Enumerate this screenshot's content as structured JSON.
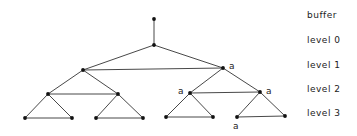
{
  "diagram": {
    "type": "tree",
    "colors": {
      "stroke": "#333333",
      "node": "#111111",
      "background": "#ffffff"
    },
    "level_labels": [
      {
        "text": "buffer",
        "y": 10
      },
      {
        "text": "level 0",
        "y": 35
      },
      {
        "text": "level 1",
        "y": 60
      },
      {
        "text": "level 2",
        "y": 84
      },
      {
        "text": "level 3",
        "y": 108
      }
    ],
    "nodes": [
      {
        "id": "buf",
        "x": 154,
        "y": 19
      },
      {
        "id": "r",
        "x": 154,
        "y": 45
      },
      {
        "id": "L",
        "x": 83,
        "y": 70
      },
      {
        "id": "R",
        "x": 223,
        "y": 68,
        "label": "a"
      },
      {
        "id": "LL",
        "x": 48,
        "y": 94
      },
      {
        "id": "LR",
        "x": 118,
        "y": 94
      },
      {
        "id": "RL",
        "x": 190,
        "y": 93,
        "label": "a"
      },
      {
        "id": "RR",
        "x": 260,
        "y": 92,
        "label": "a"
      },
      {
        "id": "LLL",
        "x": 25,
        "y": 118
      },
      {
        "id": "LLR",
        "x": 72,
        "y": 118
      },
      {
        "id": "LRL",
        "x": 96,
        "y": 118
      },
      {
        "id": "LRR",
        "x": 143,
        "y": 118
      },
      {
        "id": "RLL",
        "x": 166,
        "y": 117
      },
      {
        "id": "RLR",
        "x": 213,
        "y": 117
      },
      {
        "id": "RRL",
        "x": 237,
        "y": 117,
        "label": "a"
      },
      {
        "id": "RRR",
        "x": 285,
        "y": 116
      }
    ],
    "edges": [
      [
        "buf",
        "r"
      ],
      [
        "r",
        "L"
      ],
      [
        "r",
        "R"
      ],
      [
        "L",
        "R"
      ],
      [
        "L",
        "LL"
      ],
      [
        "L",
        "LR"
      ],
      [
        "LL",
        "LR"
      ],
      [
        "R",
        "RL"
      ],
      [
        "R",
        "RR"
      ],
      [
        "RL",
        "RR"
      ],
      [
        "LL",
        "LLL"
      ],
      [
        "LL",
        "LLR"
      ],
      [
        "LLL",
        "LLR"
      ],
      [
        "LR",
        "LRL"
      ],
      [
        "LR",
        "LRR"
      ],
      [
        "LRL",
        "LRR"
      ],
      [
        "RL",
        "RLL"
      ],
      [
        "RL",
        "RLR"
      ],
      [
        "RLL",
        "RLR"
      ],
      [
        "RR",
        "RRL"
      ],
      [
        "RR",
        "RRR"
      ],
      [
        "RRL",
        "RRR"
      ]
    ],
    "node_labels": [
      {
        "text": "a",
        "x": 229,
        "y": 61
      },
      {
        "text": "a",
        "x": 178,
        "y": 86
      },
      {
        "text": "a",
        "x": 266,
        "y": 86
      },
      {
        "text": "a",
        "x": 233,
        "y": 121
      }
    ]
  }
}
